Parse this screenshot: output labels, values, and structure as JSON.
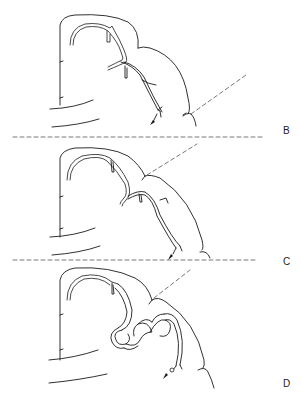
{
  "figure": {
    "panels": [
      {
        "label": "B",
        "label_pos": {
          "x": 283,
          "y": 125
        }
      },
      {
        "label": "C",
        "label_pos": {
          "x": 283,
          "y": 256
        }
      },
      {
        "label": "D",
        "label_pos": {
          "x": 283,
          "y": 378
        }
      }
    ],
    "separators": [
      {
        "y": 137,
        "x1": 13,
        "x2": 263
      },
      {
        "y": 260,
        "x1": 13,
        "x2": 256
      }
    ],
    "colors": {
      "line": "#1a1a1a",
      "dash": "#555555",
      "background": "#ffffff"
    }
  }
}
